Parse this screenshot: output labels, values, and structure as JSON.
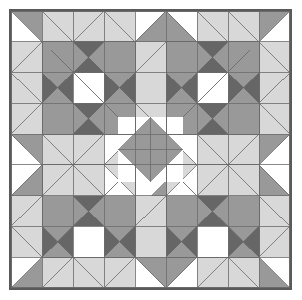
{
  "artwork": {
    "title": "Patchwork Quilt Block Diagram",
    "type": "quilt-pattern",
    "grid_columns": 9,
    "grid_rows": 9,
    "canvas_width": 302,
    "canvas_height": 300,
    "quilt_left": 9,
    "quilt_top": 9,
    "quilt_width": 283,
    "quilt_height": 281,
    "border_width": 2
  },
  "palette": {
    "white": "#ffffff",
    "light_gray": "#d8d8d8",
    "medium_gray": "#999999",
    "dark_gray": "#666666",
    "seam_line": "#6b6b6b",
    "outer_border": "#5a5a5a",
    "page_background": "#ffffff"
  },
  "legend": [
    {
      "name": "white",
      "label": "White",
      "color": "#ffffff"
    },
    {
      "name": "light-gray",
      "label": "Light Gray",
      "color": "#d8d8d8"
    },
    {
      "name": "medium-gray",
      "label": "Medium Gray",
      "color": "#999999"
    },
    {
      "name": "dark-gray",
      "label": "Dark Gray",
      "color": "#666666"
    }
  ],
  "blocks": [
    {
      "name": "star-block-top-left",
      "row": 1,
      "col": 1,
      "size": 3
    },
    {
      "name": "star-block-top-right",
      "row": 1,
      "col": 5,
      "size": 3
    },
    {
      "name": "star-block-bottom-left",
      "row": 5,
      "col": 1,
      "size": 3
    },
    {
      "name": "star-block-bottom-right",
      "row": 5,
      "col": 5,
      "size": 3
    },
    {
      "name": "center-diamond-medallion",
      "row": 4,
      "col": 4,
      "size": 2
    }
  ],
  "cells": [
    [
      "hst-tr-m",
      "hst-bl-l",
      "hst-br-l",
      "hst-bl-l",
      "hst-br-m",
      "hst-bl-m",
      "hst-tr-l",
      "hst-bl-l",
      "hst-tl-m"
    ],
    [
      "hst-br-l",
      "sq-m",
      "hg-v-dm",
      "sq-m",
      "hst-br-l",
      "sq-m",
      "hg-v-dm",
      "sq-m",
      "hst-bl-l"
    ],
    [
      "hst-tr-l",
      "hg-h-dm",
      "sq-w",
      "hg-h-dm",
      "sq-l",
      "hg-h-dm",
      "sq-w",
      "hg-h-dm",
      "hst-tl-l"
    ],
    [
      "hst-br-l",
      "sq-m",
      "hg-v-dm",
      "sq-m",
      "hst-tr-l",
      "sq-m",
      "hg-v-dm",
      "sq-m",
      "hst-bl-l"
    ],
    [
      "hst-tr-m",
      "hst-bl-l",
      "hst-br-l",
      "hst-tl-w",
      "qd-tr-m",
      "hst-tr-w",
      "hst-bl-l",
      "hst-br-l",
      "hst-tl-m"
    ],
    [
      "hst-br-m",
      "hst-tl-l",
      "hst-tr-l",
      "hst-bl-w",
      "qd-br-m",
      "hst-br-w",
      "hst-tl-l",
      "hst-tr-l",
      "hst-bl-m"
    ],
    [
      "hst-br-l",
      "sq-m",
      "hg-v-dm",
      "sq-m",
      "hst-br-l",
      "sq-m",
      "hg-v-dm",
      "sq-m",
      "hst-bl-l"
    ],
    [
      "hst-tr-l",
      "hg-h-dm",
      "sq-w",
      "hg-h-dm",
      "sq-l",
      "hg-h-dm",
      "sq-w",
      "hg-h-dm",
      "hst-tl-l"
    ],
    [
      "hst-br-m",
      "hst-tl-l",
      "hst-tr-l",
      "hst-tl-l",
      "hst-tr-m",
      "hst-tl-m",
      "hst-br-l",
      "hst-tr-l",
      "hst-bl-m"
    ]
  ],
  "cell_types": {
    "sq-w": {
      "kind": "solid",
      "fill": "white"
    },
    "sq-l": {
      "kind": "solid",
      "fill": "light_gray"
    },
    "sq-m": {
      "kind": "solid",
      "fill": "medium_gray"
    },
    "sq-d": {
      "kind": "solid",
      "fill": "dark_gray"
    },
    "hst-tl-w": {
      "kind": "half-square",
      "corner": "top-left",
      "fill": "white",
      "back": "light_gray"
    },
    "hst-tr-w": {
      "kind": "half-square",
      "corner": "top-right",
      "fill": "white",
      "back": "light_gray"
    },
    "hst-bl-w": {
      "kind": "half-square",
      "corner": "bottom-left",
      "fill": "white",
      "back": "light_gray"
    },
    "hst-br-w": {
      "kind": "half-square",
      "corner": "bottom-right",
      "fill": "white",
      "back": "light_gray"
    },
    "hst-tl-l": {
      "kind": "half-square",
      "corner": "top-left",
      "fill": "light_gray",
      "back": "light_gray"
    },
    "hst-tr-l": {
      "kind": "half-square",
      "corner": "top-right",
      "fill": "light_gray",
      "back": "light_gray"
    },
    "hst-bl-l": {
      "kind": "half-square",
      "corner": "bottom-left",
      "fill": "light_gray",
      "back": "light_gray"
    },
    "hst-br-l": {
      "kind": "half-square",
      "corner": "bottom-right",
      "fill": "light_gray",
      "back": "light_gray"
    },
    "hst-tl-m": {
      "kind": "half-square",
      "corner": "top-left",
      "fill": "medium_gray",
      "back": "white"
    },
    "hst-tr-m": {
      "kind": "half-square",
      "corner": "top-right",
      "fill": "medium_gray",
      "back": "white"
    },
    "hst-bl-m": {
      "kind": "half-square",
      "corner": "bottom-left",
      "fill": "medium_gray",
      "back": "white"
    },
    "hst-br-m": {
      "kind": "half-square",
      "corner": "bottom-right",
      "fill": "medium_gray",
      "back": "white"
    },
    "hg-v-dm": {
      "kind": "hourglass",
      "axis": "vertical",
      "fill_a": "dark_gray",
      "fill_b": "medium_gray"
    },
    "hg-h-dm": {
      "kind": "hourglass",
      "axis": "horizontal",
      "fill_a": "dark_gray",
      "fill_b": "medium_gray"
    },
    "qd-tr-m": {
      "kind": "quarter-diamond",
      "corner": "top-right",
      "fill": "medium_gray",
      "back": "white"
    },
    "qd-br-m": {
      "kind": "quarter-diamond",
      "corner": "bottom-right",
      "fill": "medium_gray",
      "back": "white"
    }
  }
}
